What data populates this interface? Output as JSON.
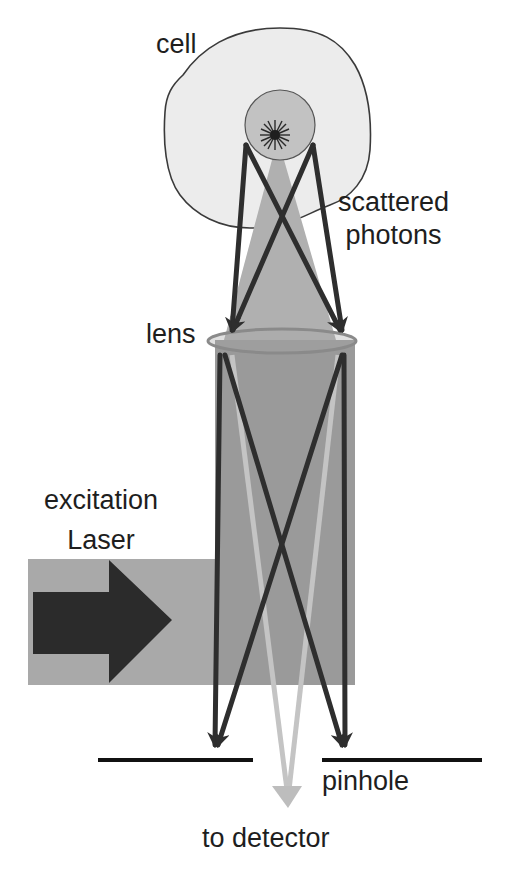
{
  "diagram": {
    "type": "confocal-microscopy-schematic",
    "labels": {
      "cell": "cell",
      "scattered_line1": "scattered",
      "scattered_line2": "photons",
      "lens": "lens",
      "excitation_line1": "excitation",
      "excitation_line2": "Laser",
      "pinhole": "pinhole",
      "detector": "to detector"
    },
    "colors": {
      "background": "#ffffff",
      "cell_fill": "#ececec",
      "cell_outline": "#3a3a3a",
      "nucleus_fill": "#c2c2c2",
      "cone_fill": "#b0b0b0",
      "column_fill": "#9a9a9a",
      "laser_fill": "#a9a9a9",
      "arrow_dark": "#2e2e2e",
      "lens_outline": "#8a8a8a",
      "detector_arrow": "#bdbdbd",
      "pinhole_plate": "#111111",
      "text": "#1e1e1e"
    },
    "elements": [
      "cell-outline",
      "nucleus",
      "fluorescent-spot",
      "light-cone",
      "lens",
      "optical-column",
      "excitation-laser-beam",
      "excitation-arrow",
      "scattered-photon-rays",
      "pinhole-plate-left",
      "pinhole-plate-right",
      "detector-arrow"
    ]
  }
}
